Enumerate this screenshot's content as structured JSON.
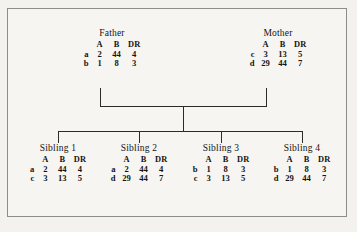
{
  "diagram": {
    "columns": [
      "A",
      "B",
      "DR"
    ],
    "line_color": "#2b2b2b",
    "frame_color": "#8d8d8d",
    "background_color": "#f7f5f1",
    "parents": [
      {
        "label": "Father",
        "rows": [
          {
            "haplotype": "a",
            "A": "2",
            "B": "44",
            "DR": "4"
          },
          {
            "haplotype": "b",
            "A": "1",
            "B": "8",
            "DR": "3"
          }
        ]
      },
      {
        "label": "Mother",
        "rows": [
          {
            "haplotype": "c",
            "A": "3",
            "B": "13",
            "DR": "5"
          },
          {
            "haplotype": "d",
            "A": "29",
            "B": "44",
            "DR": "7"
          }
        ]
      }
    ],
    "children": [
      {
        "label": "Sibling 1",
        "rows": [
          {
            "haplotype": "a",
            "A": "2",
            "B": "44",
            "DR": "4"
          },
          {
            "haplotype": "c",
            "A": "3",
            "B": "13",
            "DR": "5"
          }
        ]
      },
      {
        "label": "Sibling 2",
        "rows": [
          {
            "haplotype": "a",
            "A": "2",
            "B": "44",
            "DR": "4"
          },
          {
            "haplotype": "d",
            "A": "29",
            "B": "44",
            "DR": "7"
          }
        ]
      },
      {
        "label": "Sibling 3",
        "rows": [
          {
            "haplotype": "b",
            "A": "1",
            "B": "8",
            "DR": "3"
          },
          {
            "haplotype": "c",
            "A": "3",
            "B": "13",
            "DR": "5"
          }
        ]
      },
      {
        "label": "Sibling 4",
        "rows": [
          {
            "haplotype": "b",
            "A": "1",
            "B": "8",
            "DR": "3"
          },
          {
            "haplotype": "d",
            "A": "29",
            "B": "44",
            "DR": "7"
          }
        ]
      }
    ]
  }
}
